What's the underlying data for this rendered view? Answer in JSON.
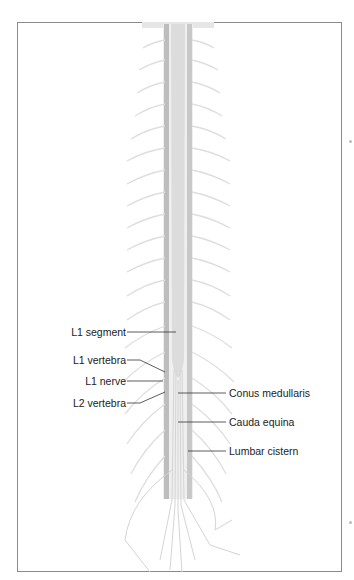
{
  "figure": {
    "colors": {
      "frame": "#8a8a8a",
      "cord": "#d9d9d9",
      "cord_dark": "#b5b5b5",
      "nerves": "#e2e2e2",
      "leader": "#333333",
      "text": "#222222"
    }
  },
  "labels": {
    "left": [
      {
        "id": "l1-segment",
        "text": "L1 segment"
      },
      {
        "id": "l1-vertebra",
        "text": "L1 vertebra"
      },
      {
        "id": "l1-nerve",
        "text": "L1 nerve"
      },
      {
        "id": "l2-vertebra",
        "text": "L2 vertebra"
      }
    ],
    "right": [
      {
        "id": "conus-medullaris",
        "text": "Conus medullaris"
      },
      {
        "id": "cauda-equina",
        "text": "Cauda equina"
      },
      {
        "id": "lumbar-cistern",
        "text": "Lumbar cistern"
      }
    ]
  }
}
